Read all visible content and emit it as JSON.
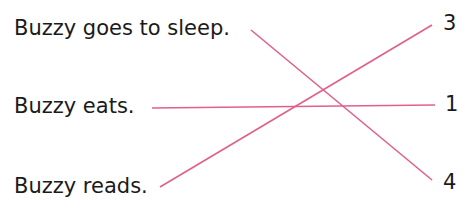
{
  "left_items": [
    {
      "text": "Buzzy goes to sleep."
    },
    {
      "text": "Buzzy eats."
    },
    {
      "text": "Buzzy reads."
    }
  ],
  "right_items": [
    {
      "text": "3"
    },
    {
      "text": "1"
    },
    {
      "text": "4"
    }
  ],
  "connections": [
    {
      "from": "Buzzy goes to sleep.",
      "to": "4"
    },
    {
      "from": "Buzzy eats.",
      "to": "1"
    },
    {
      "from": "Buzzy reads.",
      "to": "3"
    }
  ],
  "line_color": "#e0608a"
}
